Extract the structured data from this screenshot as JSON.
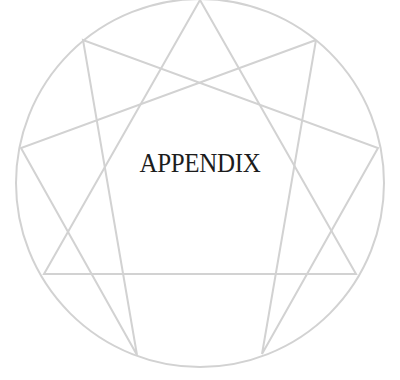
{
  "title": "APPENDIX",
  "figure": {
    "type": "enneagram",
    "line_color": "#d2d2d2",
    "text_color": "#1c1c1c",
    "circle": {
      "cx": 200,
      "cy": 183,
      "r": 184
    },
    "points": [
      [
        200,
        0
      ],
      [
        316,
        40
      ],
      [
        378,
        148
      ],
      [
        356,
        274
      ],
      [
        262,
        354
      ],
      [
        137,
        355
      ],
      [
        44,
        274
      ],
      [
        21,
        148
      ],
      [
        83,
        40
      ]
    ],
    "triangle": [
      0,
      3,
      6
    ],
    "hexad": [
      1,
      4,
      2,
      8,
      5,
      7,
      1
    ]
  }
}
